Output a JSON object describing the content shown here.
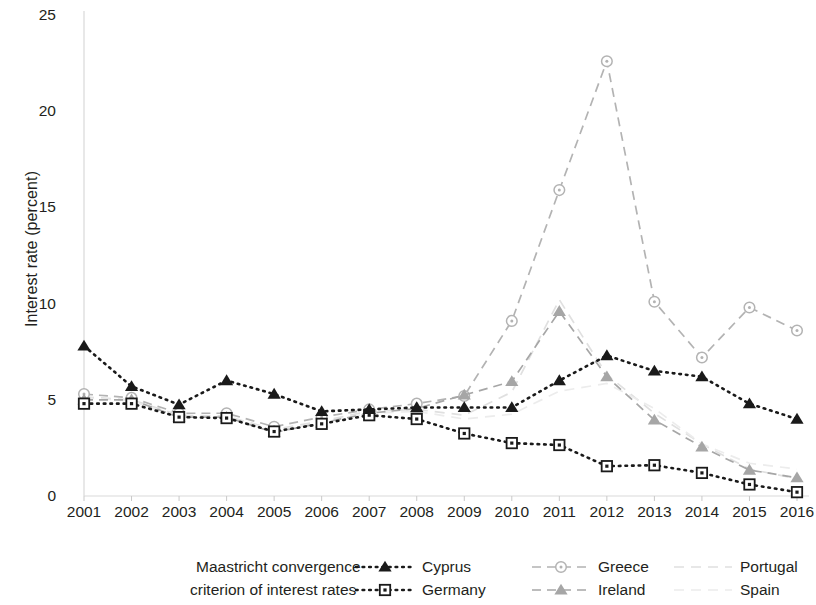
{
  "chart_data": {
    "type": "line",
    "title": "",
    "xlabel": "",
    "ylabel": "Interest rate (percent)",
    "categories": [
      "2001",
      "2002",
      "2003",
      "2004",
      "2005",
      "2006",
      "2007",
      "2008",
      "2009",
      "2010",
      "2011",
      "2012",
      "2013",
      "2014",
      "2015",
      "2016"
    ],
    "x": [
      2001,
      2002,
      2003,
      2004,
      2005,
      2006,
      2007,
      2008,
      2009,
      2010,
      2011,
      2012,
      2013,
      2014,
      2015,
      2016
    ],
    "ylim": [
      0,
      25
    ],
    "yticks": [
      0,
      5,
      10,
      15,
      20,
      25
    ],
    "xlim": [
      2001,
      2016
    ],
    "grid": false,
    "legend_position": "bottom",
    "legend_title": [
      "Maastricht convergence",
      "criterion of interest rates"
    ],
    "series": [
      {
        "name": "Cyprus",
        "color": "#1a1a1a",
        "marker": "filled-triangle",
        "linestyle": "dotted",
        "values": [
          7.8,
          5.7,
          4.75,
          6.0,
          5.3,
          4.4,
          4.5,
          4.6,
          4.6,
          4.6,
          6.0,
          7.3,
          6.5,
          6.2,
          4.8,
          4.0
        ]
      },
      {
        "name": "Germany",
        "color": "#1a1a1a",
        "marker": "open-square-dot",
        "linestyle": "dotted",
        "values": [
          4.8,
          4.8,
          4.1,
          4.05,
          3.35,
          3.75,
          4.2,
          4.0,
          3.25,
          2.75,
          2.65,
          1.55,
          1.6,
          1.2,
          0.6,
          0.2
        ]
      },
      {
        "name": "Greece",
        "color": "#b3b3b3",
        "marker": "open-circle-dot",
        "linestyle": "dashed",
        "values": [
          5.3,
          5.1,
          4.3,
          4.3,
          3.6,
          4.1,
          4.5,
          4.8,
          5.2,
          9.1,
          15.9,
          22.6,
          10.1,
          7.2,
          9.8,
          8.6
        ]
      },
      {
        "name": "Ireland",
        "color": "#a6a6a6",
        "marker": "filled-triangle-grey",
        "linestyle": "dashed",
        "values": [
          5.0,
          5.0,
          4.1,
          4.1,
          3.3,
          3.8,
          4.3,
          4.55,
          5.25,
          5.95,
          9.6,
          6.2,
          3.95,
          2.55,
          1.35,
          0.95
        ]
      },
      {
        "name": "Portugal",
        "color": "#e0e0e0",
        "marker": "none",
        "linestyle": "dashed-faint",
        "values": [
          5.15,
          5.0,
          4.2,
          4.15,
          3.45,
          3.9,
          4.4,
          4.5,
          4.2,
          5.4,
          10.2,
          6.3,
          4.3,
          2.7,
          1.4,
          0.9
        ]
      },
      {
        "name": "Spain",
        "color": "#ececec",
        "marker": "none",
        "linestyle": "dashed-faint",
        "values": [
          5.1,
          4.95,
          4.1,
          4.1,
          3.4,
          3.8,
          4.3,
          4.4,
          4.0,
          4.25,
          5.45,
          5.85,
          4.55,
          2.7,
          1.7,
          1.4
        ]
      }
    ]
  },
  "axis": {
    "y_label": "Interest rate (percent)",
    "y_ticks": [
      "0",
      "5",
      "10",
      "15",
      "20",
      "25"
    ],
    "x_ticks": [
      "2001",
      "2002",
      "2003",
      "2004",
      "2005",
      "2006",
      "2007",
      "2008",
      "2009",
      "2010",
      "2011",
      "2012",
      "2013",
      "2014",
      "2015",
      "2016"
    ]
  },
  "legend": {
    "title_line1": "Maastricht convergence",
    "title_line2": "criterion of interest rates",
    "entries": [
      {
        "label": "Cyprus",
        "marker": "filled-triangle",
        "linestyle": "dotted",
        "color": "#1a1a1a"
      },
      {
        "label": "Germany",
        "marker": "open-square-dot",
        "linestyle": "dotted",
        "color": "#1a1a1a"
      },
      {
        "label": "Greece",
        "marker": "open-circle-dot",
        "linestyle": "dashed",
        "color": "#b3b3b3"
      },
      {
        "label": "Ireland",
        "marker": "filled-triangle-grey",
        "linestyle": "dashed",
        "color": "#a6a6a6"
      },
      {
        "label": "Portugal",
        "marker": "none",
        "linestyle": "dashed-faint",
        "color": "#e0e0e0"
      },
      {
        "label": "Spain",
        "marker": "none",
        "linestyle": "dashed-faint",
        "color": "#ececec"
      }
    ]
  }
}
